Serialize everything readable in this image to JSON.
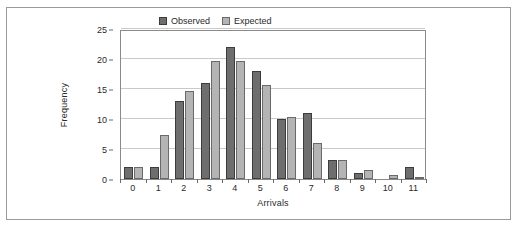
{
  "chart_data": {
    "type": "bar",
    "title": "",
    "xlabel": "Arrivals",
    "ylabel": "Frequency",
    "categories": [
      "0",
      "1",
      "2",
      "3",
      "4",
      "5",
      "6",
      "7",
      "8",
      "9",
      "10",
      "11"
    ],
    "series": [
      {
        "name": "Observed",
        "color": "#6e6e6e",
        "values": [
          2,
          2,
          13,
          16,
          22,
          18,
          10,
          11,
          3.2,
          1,
          0,
          2
        ]
      },
      {
        "name": "Expected",
        "color": "#b4b4b4",
        "values": [
          2,
          7.3,
          14.6,
          19.7,
          19.7,
          15.6,
          10.4,
          6,
          3.1,
          1.5,
          0.6,
          0.2
        ]
      }
    ],
    "ylim": [
      0,
      25
    ],
    "yticks": [
      0,
      5,
      10,
      15,
      20,
      25
    ],
    "ytick_labels": [
      "0",
      "5",
      "10",
      "15",
      "20",
      "25"
    ],
    "grid": true,
    "grid_axis": "y",
    "legend_position": "top-right-inside"
  },
  "legend": {
    "entries": [
      {
        "label": "Observed",
        "swatch": "observed-swatch"
      },
      {
        "label": "Expected",
        "swatch": "expected-swatch"
      }
    ]
  },
  "axes": {
    "x_title": "Arrivals",
    "y_title": "Frequency"
  },
  "colors": {
    "observed": "#6e6e6e",
    "observed_border": "#3c3c3c",
    "expected": "#b4b4b4",
    "expected_border": "#6a6a6a",
    "gridline": "#c9c9c9",
    "frame_border": "#9a9a9a",
    "plot_border": "#8a8a8a",
    "text": "#2a2a2a"
  }
}
